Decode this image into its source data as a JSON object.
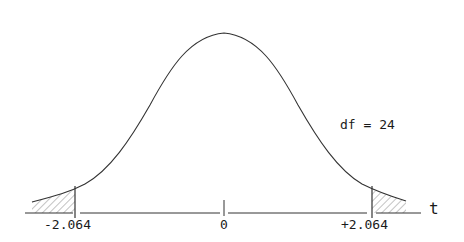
{
  "diagram": {
    "title": "",
    "type": "t-distribution two-tailed critical region",
    "df_label": "df = 24",
    "axis_label": "t",
    "ticks": [
      {
        "label": "-2.064",
        "value": -2.064
      },
      {
        "label": "0",
        "value": 0
      },
      {
        "label": "+2.064",
        "value": 2.064
      }
    ],
    "shaded_regions": [
      "left tail (t < -2.064)",
      "right tail (t > +2.064)"
    ],
    "colors": {
      "line": "#333333",
      "hatch": "#888888",
      "background": "#ffffff"
    }
  }
}
